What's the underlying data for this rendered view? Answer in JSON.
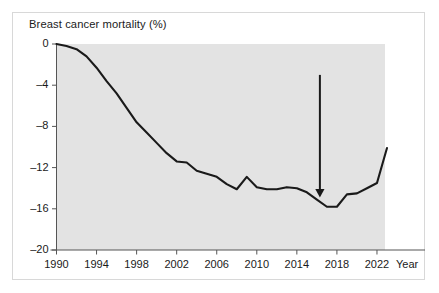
{
  "figure": {
    "title": "Breast cancer mortality (%)",
    "xaxis_title": "Year",
    "frame_color": "#d8d8d8",
    "band_color": "#e3e3e3",
    "line_color": "#1a1a1a",
    "axis_color": "#555555"
  },
  "chart_data": {
    "type": "line",
    "title": "Breast cancer mortality (%)",
    "xlabel": "Year",
    "ylabel": "Breast cancer mortality (%)",
    "xlim": [
      1990,
      2023.5
    ],
    "ylim": [
      -20,
      0
    ],
    "grid": false,
    "legend": "none",
    "xticks": [
      1990,
      1994,
      1998,
      2002,
      2006,
      2010,
      2014,
      2018,
      2022
    ],
    "xtick_labels": [
      "1990",
      "1994",
      "1998",
      "2002",
      "2006",
      "2010",
      "2014",
      "2018",
      "2022"
    ],
    "yticks": [
      0,
      -4,
      -8,
      -12,
      -16,
      -20
    ],
    "ytick_labels": [
      "0",
      "-4",
      "-8",
      "-12",
      "-16",
      "-20"
    ],
    "series": [
      {
        "name": "Breast cancer mortality",
        "x": [
          1990,
          1991,
          1992,
          1993,
          1994,
          1995,
          1996,
          1997,
          1998,
          1999,
          2000,
          2001,
          2002,
          2003,
          2004,
          2005,
          2006,
          2007,
          2008,
          2009,
          2010,
          2011,
          2012,
          2013,
          2014,
          2015,
          2016,
          2017,
          2018,
          2019,
          2020,
          2021,
          2022,
          2023
        ],
        "y": [
          0.0,
          -0.2,
          -0.5,
          -1.2,
          -2.3,
          -3.6,
          -4.8,
          -6.2,
          -7.6,
          -8.6,
          -9.6,
          -10.6,
          -11.4,
          -11.5,
          -12.3,
          -12.6,
          -12.9,
          -13.6,
          -14.1,
          -12.9,
          -13.9,
          -14.1,
          -14.1,
          -13.9,
          -14.0,
          -14.4,
          -15.1,
          -15.8,
          -15.8,
          -14.6,
          -14.5,
          -14.0,
          -13.5,
          -10.1
        ]
      }
    ],
    "annotations": [
      {
        "type": "arrow",
        "direction": "down",
        "x": 2016.3,
        "y_top": -3.0,
        "y_tip": -14.9,
        "label": ""
      }
    ],
    "shaded_band": {
      "x_start": 1990,
      "x_end": 2022.8,
      "y_start": 0,
      "y_end": -20
    }
  }
}
